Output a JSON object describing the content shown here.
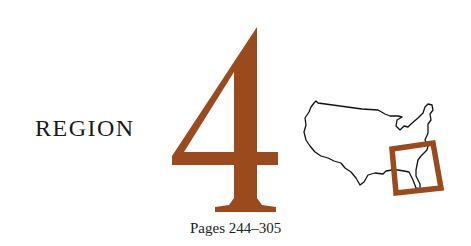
{
  "heading": {
    "label": "REGION",
    "number": "4"
  },
  "pages": {
    "text": "Pages 244–305"
  },
  "map": {
    "icon": "us-map-icon",
    "highlight": "southeast-region-box"
  },
  "colors": {
    "accent": "#9b4a1e",
    "text": "#1a1a1a",
    "map_outline": "#111111"
  }
}
